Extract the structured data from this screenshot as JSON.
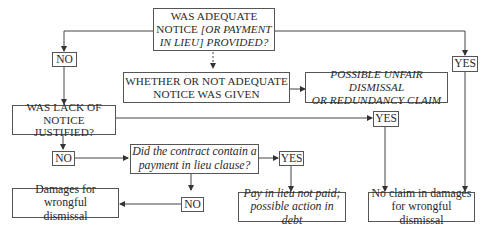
{
  "diagram": {
    "nodes": {
      "q1": {
        "line1": "WAS ADEQUATE",
        "line2a": "NOTICE ",
        "line2b": "[OR PAYMENT",
        "line3": "IN LIEU] PROVIDED?"
      },
      "whether": {
        "line1": "WHETHER OR NOT ADEQUATE",
        "line2": "NOTICE WAS GIVEN"
      },
      "unfair": {
        "line1": "POSSIBLE UNFAIR DISMISSAL",
        "line2": "OR REDUNDANCY CLAIM"
      },
      "q2": {
        "line1": "WAS LACK OF",
        "line2": "NOTICE JUSTIFIED?"
      },
      "q3": {
        "line1": "Did the contract contain a",
        "line2": "payment in lieu clause?"
      },
      "damages": {
        "line1": "Damages for wrongful",
        "line2": "dismissal"
      },
      "payinlieu": {
        "line1": "Pay in lieu not paid;",
        "line2": "possible action in debt"
      },
      "noclaim": {
        "line1": "No claim in damages",
        "line2": "for wrongful dismissal"
      }
    },
    "labels": {
      "no1": "NO",
      "yes1": "YES",
      "yes2": "YES",
      "no2": "NO",
      "yes3": "YES",
      "no3": "NO"
    }
  }
}
